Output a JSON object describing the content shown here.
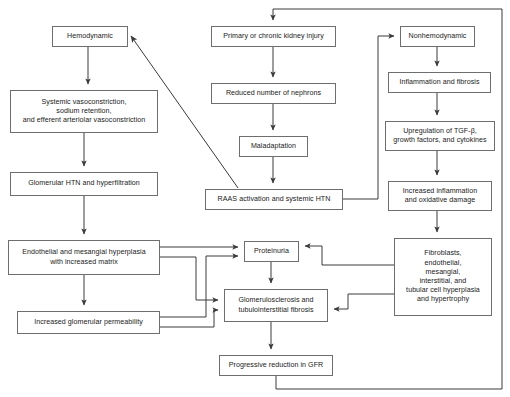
{
  "diagram": {
    "type": "flowchart",
    "canvas": {
      "width": 510,
      "height": 397
    },
    "style": {
      "box_border_color": "#6e6e6e",
      "box_fill_color": "#ffffff",
      "arrow_color": "#3a3a3a",
      "text_color": "#1a1a1a",
      "background": "#ffffff"
    },
    "columns": {
      "left": "Hemodynamic pathway",
      "center": "Injury and common pathway",
      "right": "Nonhemodynamic pathway"
    },
    "nodes": [
      {
        "id": "hemodynamic",
        "label": "Hemodynamic",
        "x": 52,
        "y": 26,
        "w": 76,
        "h": 21
      },
      {
        "id": "systemic_vasoconstriction",
        "label": "Systemic vasoconstriction,\nsodium retention,\nand efferent arteriolar vasoconstriction",
        "x": 10,
        "y": 90,
        "w": 148,
        "h": 43
      },
      {
        "id": "glomerular_htn",
        "label": "Glomerular HTN and hyperfiltration",
        "x": 10,
        "y": 172,
        "w": 148,
        "h": 24
      },
      {
        "id": "endothelial_hyperplasia",
        "label": "Endothelial and mesangial hyperplasia\nwith increased matrix",
        "x": 8,
        "y": 240,
        "w": 152,
        "h": 35
      },
      {
        "id": "increased_permeability",
        "label": "Increased glomerular permeability",
        "x": 17,
        "y": 311,
        "w": 143,
        "h": 23
      },
      {
        "id": "primary_injury",
        "label": "Primary or chronic kidney injury",
        "x": 211,
        "y": 26,
        "w": 125,
        "h": 21
      },
      {
        "id": "reduced_nephrons",
        "label": "Reduced number of nephrons",
        "x": 211,
        "y": 83,
        "w": 125,
        "h": 21
      },
      {
        "id": "maladaptation",
        "label": "Maladaptation",
        "x": 239,
        "y": 136,
        "w": 69,
        "h": 21
      },
      {
        "id": "raas_activation",
        "label": "RAAS activation and systemic HTN",
        "x": 205,
        "y": 189,
        "w": 138,
        "h": 21
      },
      {
        "id": "proteinuria",
        "label": "Proteinuria",
        "x": 244,
        "y": 241,
        "w": 55,
        "h": 21
      },
      {
        "id": "glomerulosclerosis",
        "label": "Glomerulosclerosis and\ntubulointerstitial fibrosis",
        "x": 224,
        "y": 289,
        "w": 104,
        "h": 33
      },
      {
        "id": "progressive_reduction",
        "label": "Progressive reduction in GFR",
        "x": 219,
        "y": 355,
        "w": 114,
        "h": 21
      },
      {
        "id": "nonhemodynamic",
        "label": "Nonhemodynamic",
        "x": 400,
        "y": 26,
        "w": 75,
        "h": 21
      },
      {
        "id": "inflammation_fibrosis",
        "label": "Inflammation and fibrosis",
        "x": 388,
        "y": 72,
        "w": 103,
        "h": 21
      },
      {
        "id": "upregulation_tgfb",
        "label": "Upregulation of TGF-β,\ngrowth factors, and cytokines",
        "x": 385,
        "y": 121,
        "w": 110,
        "h": 30
      },
      {
        "id": "increased_inflammation",
        "label": "Increased inflammation\nand oxidative damage",
        "x": 388,
        "y": 181,
        "w": 104,
        "h": 30
      },
      {
        "id": "fibroblasts",
        "label": "Fibroblasts,\nendothelial,\nmesangial,\ninterstitial, and\ntubular cell hyperplasia\nand hypertrophy",
        "x": 394,
        "y": 238,
        "w": 98,
        "h": 78
      }
    ],
    "edges": [
      {
        "from": "hemodynamic",
        "to": "systemic_vasoconstriction",
        "kind": "vertical-arrow"
      },
      {
        "from": "systemic_vasoconstriction",
        "to": "glomerular_htn",
        "kind": "vertical-arrow"
      },
      {
        "from": "glomerular_htn",
        "to": "endothelial_hyperplasia",
        "kind": "vertical-arrow"
      },
      {
        "from": "endothelial_hyperplasia",
        "to": "increased_permeability",
        "kind": "vertical-arrow"
      },
      {
        "from": "endothelial_hyperplasia",
        "to": "proteinuria",
        "kind": "orthogonal-arrow"
      },
      {
        "from": "endothelial_hyperplasia",
        "to": "glomerulosclerosis",
        "kind": "orthogonal-arrow"
      },
      {
        "from": "increased_permeability",
        "to": "proteinuria",
        "kind": "orthogonal-arrow"
      },
      {
        "from": "increased_permeability",
        "to": "glomerulosclerosis",
        "kind": "orthogonal-arrow"
      },
      {
        "from": "primary_injury",
        "to": "reduced_nephrons",
        "kind": "vertical-arrow"
      },
      {
        "from": "reduced_nephrons",
        "to": "maladaptation",
        "kind": "vertical-arrow"
      },
      {
        "from": "maladaptation",
        "to": "raas_activation",
        "kind": "vertical-arrow"
      },
      {
        "from": "raas_activation",
        "to": "hemodynamic",
        "kind": "diagonal-arrow"
      },
      {
        "from": "raas_activation",
        "to": "nonhemodynamic",
        "kind": "orthogonal-arrow"
      },
      {
        "from": "proteinuria",
        "to": "glomerulosclerosis",
        "kind": "vertical-arrow"
      },
      {
        "from": "glomerulosclerosis",
        "to": "progressive_reduction",
        "kind": "vertical-arrow"
      },
      {
        "from": "progressive_reduction",
        "to": "primary_injury",
        "kind": "feedback-loop"
      },
      {
        "from": "nonhemodynamic",
        "to": "inflammation_fibrosis",
        "kind": "vertical-arrow"
      },
      {
        "from": "inflammation_fibrosis",
        "to": "upregulation_tgfb",
        "kind": "vertical-arrow"
      },
      {
        "from": "upregulation_tgfb",
        "to": "increased_inflammation",
        "kind": "vertical-arrow"
      },
      {
        "from": "increased_inflammation",
        "to": "fibroblasts",
        "kind": "vertical-arrow"
      },
      {
        "from": "fibroblasts",
        "to": "proteinuria",
        "kind": "orthogonal-arrow"
      },
      {
        "from": "fibroblasts",
        "to": "glomerulosclerosis",
        "kind": "orthogonal-arrow"
      }
    ]
  }
}
